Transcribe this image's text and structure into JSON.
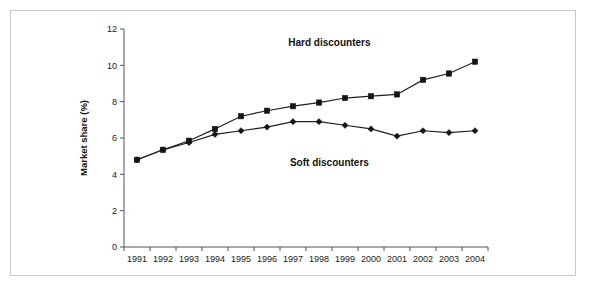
{
  "figure": {
    "border_color": "#c9c9c9",
    "background": "#ffffff"
  },
  "chart_data": {
    "type": "line",
    "title": "",
    "subtitle": "",
    "xlabel": "",
    "ylabel": "Market share (%)",
    "categories": [
      "1991",
      "1992",
      "1993",
      "1994",
      "1995",
      "1996",
      "1997",
      "1998",
      "1999",
      "2000",
      "2001",
      "2002",
      "2003",
      "2004"
    ],
    "x": [
      1991,
      1992,
      1993,
      1994,
      1995,
      1996,
      1997,
      1998,
      1999,
      2000,
      2001,
      2002,
      2003,
      2004
    ],
    "ylim": [
      0,
      12
    ],
    "yticks": [
      0,
      2,
      4,
      6,
      8,
      10,
      12
    ],
    "ytick_labels": [
      "0",
      "2",
      "4",
      "6",
      "8",
      "10",
      "12"
    ],
    "grid": false,
    "legend_position": "inline-annotations",
    "series": [
      {
        "name": "Hard discounters",
        "marker": "square",
        "color": "#151515",
        "label_x": 1998.4,
        "label_y": 11.05,
        "values": [
          4.8,
          5.35,
          5.85,
          6.5,
          7.2,
          7.5,
          7.75,
          7.95,
          8.2,
          8.3,
          8.4,
          9.2,
          9.55,
          10.2
        ]
      },
      {
        "name": "Soft discounters",
        "marker": "diamond",
        "color": "#151515",
        "label_x": 1998.4,
        "label_y": 4.45,
        "values": [
          4.8,
          5.35,
          5.75,
          6.2,
          6.4,
          6.6,
          6.9,
          6.9,
          6.7,
          6.5,
          6.1,
          6.4,
          6.3,
          6.4
        ]
      }
    ],
    "annotations": [
      {
        "text": "Hard discounters",
        "x": 1998.4,
        "y": 11.05
      },
      {
        "text": "Soft discounters",
        "x": 1998.4,
        "y": 4.45
      }
    ]
  }
}
